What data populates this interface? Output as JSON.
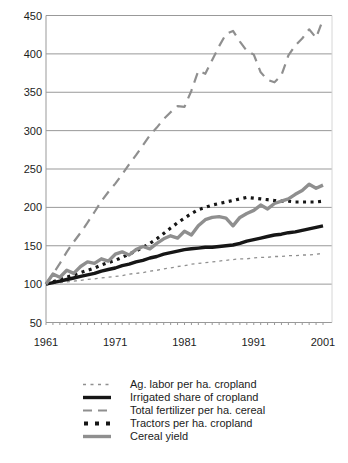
{
  "chart_data": {
    "type": "line",
    "title": "",
    "xlabel": "",
    "ylabel": "",
    "x_range": [
      1961,
      2001
    ],
    "ylim": [
      50,
      450
    ],
    "y_ticks": [
      50,
      100,
      150,
      200,
      250,
      300,
      350,
      400,
      450
    ],
    "x_ticks": [
      1961,
      1971,
      1981,
      1991,
      2001
    ],
    "grid": "horizontal",
    "legend_position": "bottom",
    "axis_color": "#999999",
    "x": [
      1961,
      1962,
      1963,
      1964,
      1965,
      1966,
      1967,
      1968,
      1969,
      1970,
      1971,
      1972,
      1973,
      1974,
      1975,
      1976,
      1977,
      1978,
      1979,
      1980,
      1981,
      1982,
      1983,
      1984,
      1985,
      1986,
      1987,
      1988,
      1989,
      1990,
      1991,
      1992,
      1993,
      1994,
      1995,
      1996,
      1997,
      1998,
      1999,
      2000,
      2001
    ],
    "series": [
      {
        "id": "ag-labor",
        "label": "Ag. labor per ha. cropland",
        "color": "#909090",
        "width": 1.3,
        "dash": "3,4",
        "values": [
          100,
          101,
          102,
          103,
          104,
          105,
          106,
          107,
          108,
          109,
          110,
          111,
          113,
          114,
          115,
          117,
          118,
          120,
          121,
          123,
          124,
          126,
          127,
          128,
          129,
          130,
          131,
          132,
          133,
          133,
          134,
          135,
          135,
          136,
          136,
          137,
          137,
          138,
          138,
          139,
          140
        ]
      },
      {
        "id": "irrigated",
        "label": "Irrigated share of cropland",
        "color": "#161616",
        "width": 3.4,
        "dash": "",
        "values": [
          100,
          102,
          104,
          106,
          108,
          110,
          112,
          114,
          117,
          119,
          121,
          124,
          126,
          129,
          131,
          134,
          136,
          139,
          141,
          143,
          145,
          146,
          147,
          148,
          148,
          149,
          150,
          151,
          153,
          156,
          158,
          160,
          162,
          164,
          165,
          167,
          168,
          170,
          172,
          174,
          176
        ]
      },
      {
        "id": "fertilizer",
        "label": "Total fertilizer per ha. cereal",
        "color": "#8f8f8f",
        "width": 2.2,
        "dash": "10,7",
        "values": [
          100,
          113,
          127,
          142,
          155,
          167,
          180,
          194,
          208,
          220,
          231,
          243,
          256,
          268,
          281,
          294,
          304,
          315,
          324,
          332,
          331,
          352,
          378,
          374,
          392,
          410,
          426,
          430,
          416,
          404,
          399,
          376,
          366,
          363,
          372,
          398,
          411,
          420,
          432,
          421,
          445
        ]
      },
      {
        "id": "tractors",
        "label": "Tractors per ha. cropland",
        "color": "#161616",
        "width": 3.2,
        "dash": "3,4.5",
        "values": [
          100,
          103,
          106,
          109,
          112,
          115,
          118,
          121,
          125,
          128,
          131,
          135,
          139,
          143,
          148,
          153,
          159,
          166,
          173,
          180,
          186,
          192,
          197,
          200,
          203,
          205,
          207,
          209,
          211,
          213,
          212,
          211,
          210,
          209,
          208,
          208,
          207,
          207,
          207,
          207,
          208
        ]
      },
      {
        "id": "cereal",
        "label": "Cereal yield",
        "color": "#8f8f8f",
        "width": 3.4,
        "dash": "",
        "values": [
          100,
          113,
          109,
          118,
          114,
          123,
          129,
          127,
          133,
          130,
          139,
          142,
          138,
          145,
          149,
          146,
          153,
          159,
          163,
          160,
          169,
          164,
          176,
          184,
          187,
          188,
          186,
          176,
          187,
          192,
          196,
          203,
          198,
          205,
          208,
          211,
          217,
          222,
          230,
          225,
          229
        ]
      }
    ]
  }
}
